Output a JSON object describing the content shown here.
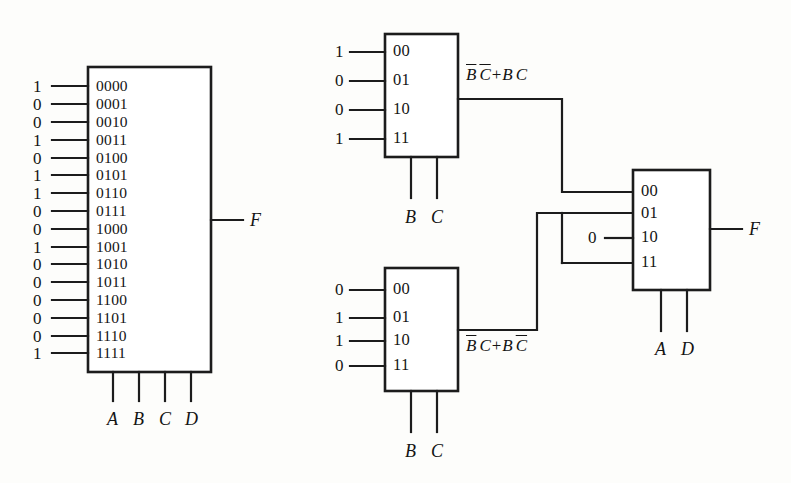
{
  "diagram": {
    "output_label": "F",
    "constant_zero": "0",
    "ink_color": "#1c1c1c",
    "background_color": "#fdfdfb"
  },
  "mux_16to1": {
    "name": "16-to-1 multiplexer",
    "input_values": [
      "1",
      "0",
      "0",
      "1",
      "0",
      "1",
      "1",
      "0",
      "0",
      "1",
      "0",
      "0",
      "0",
      "0",
      "0",
      "1"
    ],
    "input_codes": [
      "0000",
      "0001",
      "0010",
      "0011",
      "0100",
      "0101",
      "0110",
      "0111",
      "1000",
      "1001",
      "1010",
      "1011",
      "1100",
      "1101",
      "1110",
      "1111"
    ],
    "select_labels": [
      "A",
      "B",
      "C",
      "D"
    ],
    "output_label": "F"
  },
  "mux_top": {
    "name": "4-to-1 multiplexer (top)",
    "input_values": [
      "1",
      "0",
      "0",
      "1"
    ],
    "input_codes": [
      "00",
      "01",
      "10",
      "11"
    ],
    "select_labels": [
      "B",
      "C"
    ],
    "output_expression": {
      "text": "B̅ C̅ + B C",
      "parts": [
        {
          "t": "B",
          "overline": true
        },
        {
          "t": "C",
          "overline": true
        },
        {
          "t": "+",
          "op": true
        },
        {
          "t": "B",
          "overline": false
        },
        {
          "t": "C",
          "overline": false
        }
      ]
    }
  },
  "mux_bottom": {
    "name": "4-to-1 multiplexer (bottom)",
    "input_values": [
      "0",
      "1",
      "1",
      "0"
    ],
    "input_codes": [
      "00",
      "01",
      "10",
      "11"
    ],
    "select_labels": [
      "B",
      "C"
    ],
    "output_expression": {
      "text": "B̅ C + B C̅",
      "parts": [
        {
          "t": "B",
          "overline": true
        },
        {
          "t": "C",
          "overline": false
        },
        {
          "t": "+",
          "op": true
        },
        {
          "t": "B",
          "overline": false
        },
        {
          "t": "C",
          "overline": true
        }
      ]
    }
  },
  "mux_right": {
    "name": "4-to-1 multiplexer (right)",
    "input_codes": [
      "00",
      "01",
      "10",
      "11"
    ],
    "input_sources": [
      "from-top-mux",
      "from-bottom-mux",
      "constant-0",
      "from-bottom-mux"
    ],
    "constant_input_value": "0",
    "select_labels": [
      "A",
      "D"
    ],
    "output_label": "F"
  }
}
